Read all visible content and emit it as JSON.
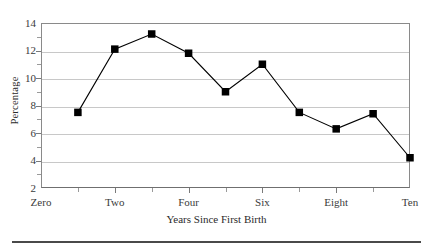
{
  "chart_data": {
    "type": "line",
    "title": "",
    "xlabel": "Years Since First Birth",
    "ylabel": "Percentage",
    "x": [
      1,
      2,
      3,
      4,
      5,
      6,
      7,
      8,
      9,
      10
    ],
    "values": [
      7.5,
      12.1,
      13.2,
      11.8,
      9.0,
      11.0,
      7.5,
      6.3,
      7.4,
      4.2
    ],
    "series": [
      {
        "name": "Percentage",
        "values": [
          7.5,
          12.1,
          13.2,
          11.8,
          9.0,
          11.0,
          7.5,
          6.3,
          7.4,
          4.2
        ]
      }
    ],
    "xlim": [
      0,
      10
    ],
    "ylim": [
      2,
      14
    ],
    "x_major_ticks": [
      0,
      2,
      4,
      6,
      8,
      10
    ],
    "x_major_tick_labels": [
      "Zero",
      "Two",
      "Four",
      "Six",
      "Eight",
      "Ten"
    ],
    "x_minor_ticks": [
      1,
      3,
      5,
      7,
      9
    ],
    "y_major_ticks": [
      2,
      4,
      6,
      8,
      10,
      12,
      14
    ],
    "y_major_tick_labels": [
      "2",
      "4",
      "6",
      "8",
      "10",
      "12",
      "14"
    ],
    "y_minor_ticks": [
      3,
      5,
      7,
      9,
      11,
      13
    ],
    "grid": "horizontal",
    "legend": "none",
    "marker": "filled-square",
    "marker_color": "#000000",
    "line_color": "#000000",
    "grid_color": "#c8c8c8",
    "axis_color": "#8a8a8a",
    "background": "#ffffff"
  },
  "footer": {
    "rule_color": "#4a4a4a"
  }
}
